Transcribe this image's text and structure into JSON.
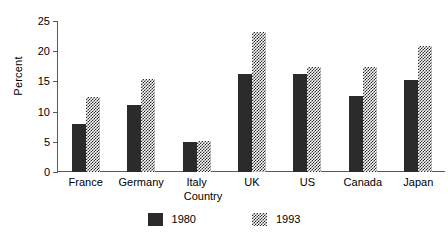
{
  "chart_data": {
    "type": "bar",
    "title": "",
    "xlabel": "Country",
    "ylabel": "Percent",
    "categories": [
      "France",
      "Germany",
      "Italy",
      "UK",
      "US",
      "Canada",
      "Japan"
    ],
    "series": [
      {
        "name": "1980",
        "values": [
          7.9,
          11.1,
          5.0,
          16.2,
          16.2,
          12.6,
          15.2
        ],
        "color": "#2b2b2b",
        "fill": "solid"
      },
      {
        "name": "1993",
        "values": [
          12.4,
          15.4,
          5.1,
          23.2,
          17.4,
          17.4,
          20.9
        ],
        "color": "#2b2b2b",
        "fill": "checker"
      }
    ],
    "ylim": [
      0,
      25
    ],
    "yticks": [
      0,
      5,
      10,
      15,
      20,
      25
    ],
    "ytick_labels": [
      "0",
      "5",
      "10",
      "15",
      "20",
      "25"
    ],
    "grid": false,
    "legend": {
      "position": "bottom",
      "entries": [
        "1980",
        "1993"
      ]
    },
    "axis_color": "#5a5a5a"
  }
}
